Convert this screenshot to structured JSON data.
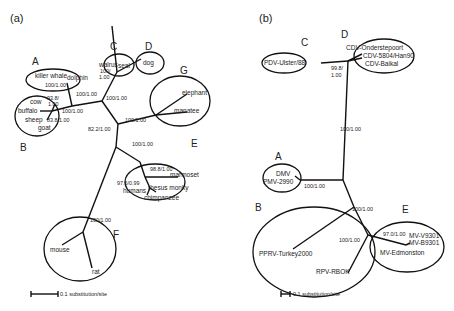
{
  "panels": {
    "a": {
      "label": "(a)",
      "clades": {
        "A": {
          "letter": "A",
          "taxa": [
            "killer whale",
            "dolphin"
          ],
          "support": "100/1.00"
        },
        "B": {
          "letter": "B",
          "taxa": [
            "cow",
            "buffalo",
            "sheep",
            "goat"
          ],
          "support_cow": "1.00",
          "support_cow_top": "93.8/",
          "support_sheep": "83.8/1.00"
        },
        "C": {
          "letter": "C",
          "taxa": [
            "walrus",
            "seal"
          ],
          "support_top": "100/",
          "support_bottom": "1.00"
        },
        "D": {
          "letter": "D",
          "taxa": [
            "dog"
          ]
        },
        "E": {
          "letter": "E",
          "taxa": [
            "marmoset",
            "rhesus monky",
            "humans",
            "chimpanzee"
          ],
          "support_inner": "98.8/1.00",
          "support_humans": "97.6/0.99"
        },
        "F": {
          "letter": "F",
          "taxa": [
            "mouse",
            "rat"
          ]
        },
        "G": {
          "letter": "G",
          "taxa": [
            "elephant",
            "manatee"
          ]
        }
      },
      "branch_supports": {
        "AB": "100/1.00",
        "AB_inner": "100/1.00",
        "CD": "100/1.00",
        "G": "100/1.00",
        "root": "82.2/1.00",
        "E": "100/1.00",
        "F": "100/1.00"
      },
      "scale_bar": "0.1 substitution/site"
    },
    "b": {
      "label": "(b)",
      "clades": {
        "A": {
          "letter": "A",
          "taxa": [
            "DMV",
            "PMV-2990"
          ]
        },
        "B": {
          "letter": "B",
          "taxa": [
            "PPRV-Turkey2000",
            "RPV-RBOK"
          ]
        },
        "C": {
          "letter": "C",
          "taxa": [
            "PDV-Ulster/88"
          ]
        },
        "D": {
          "letter": "D",
          "taxa": [
            "CDV-Onderstepoort",
            "CDV-5804/Han90",
            "CDV-Baikal"
          ],
          "support_top": "99.8/",
          "support_bottom": "1.00"
        },
        "E": {
          "letter": "E",
          "taxa": [
            "MV-V9301",
            "MV-B9301",
            "MV-Edmonston"
          ],
          "support": "97.0/1.00"
        }
      },
      "branch_supports": {
        "CD": "100/1.00",
        "A": "100/1.00",
        "BE": "100/1.00",
        "B_inner": "100/1.00"
      },
      "scale_bar": "0.1 substitution/site"
    }
  }
}
